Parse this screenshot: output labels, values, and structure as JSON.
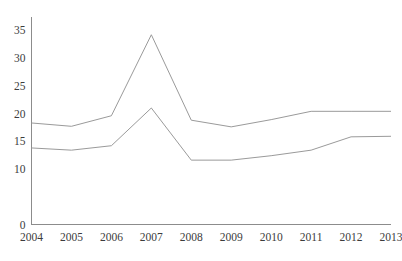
{
  "chart_data": {
    "type": "line",
    "title": "",
    "subtitle": "",
    "xlabel": "",
    "ylabel": "",
    "categories": [
      "2004",
      "2005",
      "2006",
      "2007",
      "2008",
      "2009",
      "2010",
      "2011",
      "2012",
      "2013"
    ],
    "x": [
      2004,
      2005,
      2006,
      2007,
      2008,
      2009,
      2010,
      2011,
      2012,
      2013
    ],
    "series": [
      {
        "name": "upper-series",
        "color": "#9a9a9a",
        "values": [
          18.3,
          17.7,
          19.6,
          34.2,
          18.8,
          17.6,
          18.9,
          20.4,
          20.4,
          20.4
        ]
      },
      {
        "name": "lower-series",
        "color": "#9a9a9a",
        "values": [
          13.8,
          13.4,
          14.2,
          21.0,
          11.6,
          11.6,
          12.4,
          13.4,
          15.8,
          15.9
        ]
      }
    ],
    "ylim": [
      0,
      36.5
    ],
    "xlim": [
      2004,
      2013
    ],
    "y_tick_values": [
      0,
      10,
      15,
      20,
      25,
      30,
      35
    ],
    "y_tick_labels": [
      "0",
      "10",
      "15",
      "20",
      "25",
      "30",
      "35"
    ],
    "x_tick_labels": [
      "2004",
      "2005",
      "2006",
      "2007",
      "2008",
      "2009",
      "2010",
      "2011",
      "2012",
      "2013"
    ],
    "grid": false,
    "legend": false,
    "legend_position": "none",
    "annotations": [],
    "axis_color": "#8c8c8c",
    "background_color": "#ffffff",
    "text_color": "#3c3c3c"
  }
}
